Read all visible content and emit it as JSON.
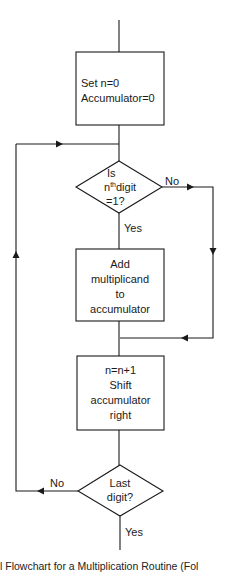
{
  "diagram": {
    "type": "flowchart",
    "stroke_color": "#1a1a1a",
    "background": "#ffffff",
    "nodes": [
      {
        "id": "init",
        "shape": "process",
        "lines": [
          "Set n=0",
          "Accumulator=0"
        ]
      },
      {
        "id": "check_digit",
        "shape": "decision",
        "line1": "Is",
        "line2_base": "n",
        "line2_sup": "th",
        "line2_rest": "digit",
        "line3": "=1?"
      },
      {
        "id": "add",
        "shape": "process",
        "lines": [
          "Add",
          "multiplicand",
          "to",
          "accumulator"
        ]
      },
      {
        "id": "shift",
        "shape": "process",
        "lines": [
          "n=n+1",
          "Shift",
          "accumulator",
          "right"
        ]
      },
      {
        "id": "check_last",
        "shape": "decision",
        "lines": [
          "Last",
          "digit?"
        ]
      }
    ],
    "edges": [
      {
        "from": "start",
        "to": "init"
      },
      {
        "from": "init",
        "to": "check_digit"
      },
      {
        "from": "check_digit",
        "to": "add",
        "label": "Yes"
      },
      {
        "from": "check_digit",
        "to": "join",
        "label": "No"
      },
      {
        "from": "add",
        "to": "join"
      },
      {
        "from": "join",
        "to": "shift"
      },
      {
        "from": "shift",
        "to": "check_last"
      },
      {
        "from": "check_last",
        "to": "check_digit",
        "label": "No"
      },
      {
        "from": "check_last",
        "to": "end",
        "label": "Yes"
      }
    ],
    "labels": {
      "no_1": "No",
      "yes_1": "Yes",
      "no_2": "No",
      "yes_2": "Yes"
    },
    "caption": "l Flowchart for a Multiplication Routine (Fol"
  }
}
